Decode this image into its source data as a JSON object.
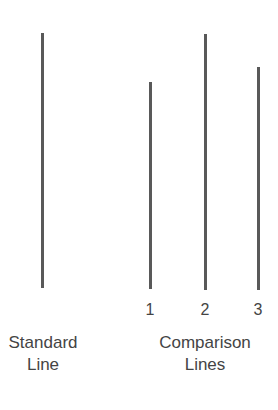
{
  "diagram": {
    "standard": {
      "label_line1": "Standard",
      "label_line2": "Line",
      "line": {
        "x": 42,
        "top": 33,
        "bottom": 288
      }
    },
    "comparison": {
      "label_line1": "Comparison",
      "label_line2": "Lines",
      "lines": [
        {
          "number": "1",
          "x": 150,
          "top": 82,
          "bottom": 289
        },
        {
          "number": "2",
          "x": 205,
          "top": 34,
          "bottom": 290
        },
        {
          "number": "3",
          "x": 258,
          "top": 67,
          "bottom": 290
        }
      ]
    },
    "line_color": "#595959",
    "text_color": "#444444"
  }
}
